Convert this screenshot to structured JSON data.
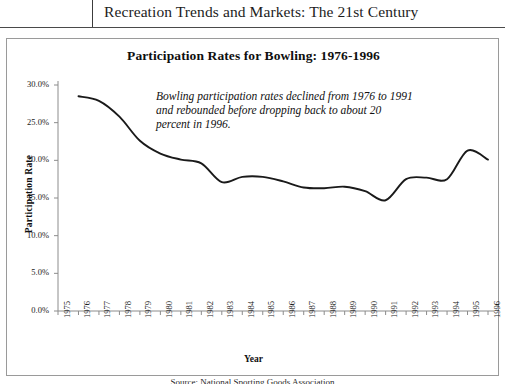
{
  "header": {
    "title": "Recreation Trends and Markets: The 21st Century"
  },
  "figure": {
    "chart_title": "Participation Rates for Bowling: 1976-1996",
    "annotation": "Bowling participation rates declined from 1976 to 1991 and rebounded before dropping back to about 20 percent in 1996."
  },
  "caption": {
    "text": "Source: National Sporting Goods Association"
  },
  "chart_data": {
    "type": "line",
    "title": "Participation Rates for Bowling: 1976-1996",
    "xlabel": "Year",
    "ylabel": "Participation Rate",
    "xlim": [
      1975,
      1996
    ],
    "ylim": [
      0,
      30
    ],
    "grid": false,
    "legend": "none",
    "ytick_labels": [
      "0.0%",
      "5.0%",
      "10.0%",
      "15.0%",
      "20.0%",
      "25.0%",
      "30.0%"
    ],
    "ytick_values": [
      0,
      5,
      10,
      15,
      20,
      25,
      30
    ],
    "xtick_labels": [
      "1975",
      "1976",
      "1977",
      "1978",
      "1979",
      "1980",
      "1981",
      "1982",
      "1983",
      "1984",
      "1985",
      "1986",
      "1987",
      "1988",
      "1989",
      "1990",
      "1991",
      "1992",
      "1993",
      "1994",
      "1995",
      "1996"
    ],
    "x": [
      1976,
      1977,
      1978,
      1979,
      1980,
      1981,
      1982,
      1983,
      1984,
      1985,
      1986,
      1987,
      1988,
      1989,
      1990,
      1991,
      1992,
      1993,
      1994,
      1995,
      1996
    ],
    "values": [
      28.5,
      27.9,
      25.8,
      22.6,
      20.9,
      20.1,
      19.6,
      17.1,
      17.8,
      17.8,
      17.2,
      16.4,
      16.3,
      16.5,
      15.9,
      14.7,
      17.5,
      17.7,
      17.5,
      21.3,
      20.1
    ],
    "series": [
      {
        "name": "Bowling participation rate",
        "color": "#1a1a1a",
        "values": [
          28.5,
          27.9,
          25.8,
          22.6,
          20.9,
          20.1,
          19.6,
          17.1,
          17.8,
          17.8,
          17.2,
          16.4,
          16.3,
          16.5,
          15.9,
          14.7,
          17.5,
          17.7,
          17.5,
          21.3,
          20.1
        ]
      }
    ]
  }
}
